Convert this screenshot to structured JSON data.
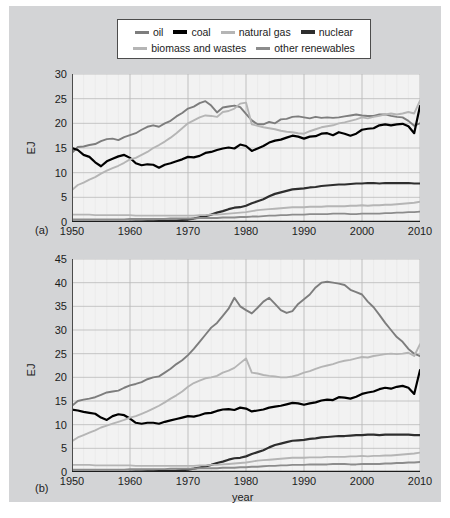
{
  "legend": {
    "rows": [
      [
        {
          "label": "oil",
          "color": "#7d7d7d",
          "width": 3
        },
        {
          "label": "coal",
          "color": "#000000",
          "width": 4
        },
        {
          "label": "natural gas",
          "color": "#b5b5b5",
          "width": 3
        },
        {
          "label": "nuclear",
          "color": "#2e2e2e",
          "width": 4
        }
      ],
      [
        {
          "label": "biomass and wastes",
          "color": "#b5b5b5",
          "width": 3
        },
        {
          "label": "other renewables",
          "color": "#8c8c8c",
          "width": 3
        }
      ]
    ]
  },
  "panel_a": {
    "tag": "(a)",
    "ylabel": "EJ"
  },
  "panel_b": {
    "tag": "(b)",
    "ylabel": "EJ",
    "xlabel": "year"
  },
  "chart_data": [
    {
      "type": "line",
      "panel": "(a)",
      "title": "",
      "xlabel": "",
      "ylabel": "EJ",
      "xlim": [
        1950,
        2010
      ],
      "ylim": [
        0,
        30
      ],
      "yticks": [
        0,
        5,
        10,
        15,
        20,
        25,
        30
      ],
      "xticks": [
        1950,
        1960,
        1970,
        1980,
        1990,
        2000,
        2010
      ],
      "grid": true,
      "legend_position": "top",
      "x": [
        1950,
        1951,
        1952,
        1953,
        1954,
        1955,
        1956,
        1957,
        1958,
        1959,
        1960,
        1961,
        1962,
        1963,
        1964,
        1965,
        1966,
        1967,
        1968,
        1969,
        1970,
        1971,
        1972,
        1973,
        1974,
        1975,
        1976,
        1977,
        1978,
        1979,
        1980,
        1981,
        1982,
        1983,
        1984,
        1985,
        1986,
        1987,
        1988,
        1989,
        1990,
        1991,
        1992,
        1993,
        1994,
        1995,
        1996,
        1997,
        1998,
        1999,
        2000,
        2001,
        2002,
        2003,
        2004,
        2005,
        2006,
        2007,
        2008,
        2009,
        2010
      ],
      "series": [
        {
          "name": "oil",
          "color": "#7d7d7d",
          "values": [
            14.0,
            15.2,
            15.3,
            15.6,
            15.8,
            16.4,
            16.8,
            16.9,
            16.6,
            17.2,
            17.6,
            18.0,
            18.7,
            19.3,
            19.6,
            19.3,
            20.0,
            20.5,
            21.4,
            22.1,
            23.0,
            23.4,
            24.1,
            24.5,
            23.6,
            22.2,
            23.2,
            23.4,
            23.6,
            23.3,
            21.9,
            20.6,
            19.8,
            19.8,
            20.3,
            20.0,
            20.8,
            20.9,
            21.3,
            21.4,
            21.2,
            21.0,
            21.3,
            21.1,
            21.2,
            21.1,
            21.2,
            21.4,
            21.6,
            21.8,
            21.6,
            21.5,
            21.5,
            21.8,
            21.8,
            21.5,
            21.3,
            21.2,
            20.5,
            19.5,
            20.0
          ]
        },
        {
          "name": "coal",
          "color": "#000000",
          "values": [
            15.0,
            14.6,
            13.6,
            13.2,
            12.1,
            11.3,
            12.3,
            12.8,
            13.3,
            13.6,
            13.0,
            11.9,
            11.5,
            11.7,
            11.6,
            11.0,
            11.6,
            11.9,
            12.3,
            12.7,
            13.2,
            13.1,
            13.4,
            14.0,
            14.2,
            14.6,
            14.9,
            15.1,
            14.9,
            15.7,
            15.4,
            14.4,
            14.9,
            15.4,
            16.1,
            16.5,
            16.7,
            17.1,
            17.5,
            17.3,
            16.9,
            17.3,
            17.4,
            17.9,
            18.0,
            17.6,
            18.2,
            17.9,
            17.5,
            17.9,
            18.7,
            18.9,
            19.0,
            19.6,
            19.8,
            19.6,
            19.8,
            19.9,
            19.4,
            18.0,
            23.5
          ]
        },
        {
          "name": "natural gas",
          "color": "#b5b5b5",
          "values": [
            6.5,
            7.5,
            8.0,
            8.6,
            9.1,
            9.8,
            10.4,
            10.9,
            11.4,
            12.0,
            12.7,
            13.0,
            13.6,
            14.2,
            15.0,
            15.6,
            16.3,
            17.1,
            18.0,
            19.0,
            20.0,
            20.6,
            21.2,
            21.6,
            21.5,
            21.3,
            22.3,
            22.5,
            23.0,
            24.0,
            24.2,
            19.8,
            19.5,
            19.2,
            19.0,
            18.8,
            18.5,
            18.3,
            18.2,
            18.0,
            17.9,
            18.4,
            18.8,
            19.2,
            19.4,
            19.6,
            20.0,
            20.2,
            20.5,
            20.8,
            21.2,
            21.0,
            21.3,
            21.5,
            21.8,
            22.0,
            21.8,
            22.0,
            22.3,
            22.0,
            24.6
          ]
        },
        {
          "name": "nuclear",
          "color": "#2e2e2e",
          "values": [
            0.0,
            0.0,
            0.0,
            0.0,
            0.0,
            0.0,
            0.0,
            0.0,
            0.0,
            0.0,
            0.05,
            0.07,
            0.1,
            0.12,
            0.15,
            0.18,
            0.22,
            0.26,
            0.3,
            0.4,
            0.5,
            0.7,
            0.95,
            1.2,
            1.5,
            1.9,
            2.2,
            2.6,
            2.9,
            3.0,
            3.3,
            3.8,
            4.2,
            4.6,
            5.2,
            5.7,
            6.0,
            6.3,
            6.6,
            6.7,
            6.8,
            7.0,
            7.1,
            7.3,
            7.4,
            7.5,
            7.6,
            7.6,
            7.7,
            7.8,
            7.8,
            7.9,
            7.9,
            7.8,
            7.9,
            7.9,
            7.9,
            7.9,
            7.9,
            7.8,
            7.8
          ]
        },
        {
          "name": "biomass and wastes",
          "color": "#b5b5b5",
          "values": [
            1.5,
            1.5,
            1.5,
            1.5,
            1.4,
            1.4,
            1.4,
            1.4,
            1.4,
            1.4,
            1.4,
            1.3,
            1.3,
            1.3,
            1.3,
            1.3,
            1.3,
            1.3,
            1.3,
            1.3,
            1.3,
            1.3,
            1.4,
            1.4,
            1.5,
            1.5,
            1.6,
            1.7,
            1.8,
            1.9,
            2.0,
            2.2,
            2.4,
            2.5,
            2.6,
            2.7,
            2.8,
            2.9,
            3.0,
            3.0,
            3.0,
            3.1,
            3.1,
            3.1,
            3.2,
            3.2,
            3.2,
            3.2,
            3.3,
            3.3,
            3.4,
            3.3,
            3.4,
            3.4,
            3.5,
            3.5,
            3.6,
            3.7,
            3.8,
            3.9,
            4.1
          ]
        },
        {
          "name": "other renewables",
          "color": "#8c8c8c",
          "values": [
            0.5,
            0.5,
            0.5,
            0.5,
            0.5,
            0.5,
            0.5,
            0.5,
            0.5,
            0.5,
            0.6,
            0.6,
            0.6,
            0.6,
            0.6,
            0.6,
            0.6,
            0.7,
            0.7,
            0.7,
            0.7,
            0.7,
            0.8,
            0.8,
            0.8,
            0.8,
            0.9,
            0.9,
            0.9,
            1.0,
            1.0,
            1.1,
            1.1,
            1.2,
            1.3,
            1.3,
            1.4,
            1.4,
            1.5,
            1.5,
            1.5,
            1.6,
            1.6,
            1.6,
            1.6,
            1.7,
            1.7,
            1.7,
            1.6,
            1.6,
            1.7,
            1.7,
            1.7,
            1.7,
            1.8,
            1.8,
            1.9,
            1.9,
            2.0,
            2.0,
            2.1
          ]
        }
      ]
    },
    {
      "type": "line",
      "panel": "(b)",
      "title": "",
      "xlabel": "year",
      "ylabel": "EJ",
      "xlim": [
        1950,
        2010
      ],
      "ylim": [
        0,
        45
      ],
      "yticks": [
        0,
        5,
        10,
        15,
        20,
        25,
        30,
        35,
        40,
        45
      ],
      "xticks": [
        1950,
        1960,
        1970,
        1980,
        1990,
        2000,
        2010
      ],
      "grid": true,
      "legend_position": "top",
      "x": [
        1950,
        1951,
        1952,
        1953,
        1954,
        1955,
        1956,
        1957,
        1958,
        1959,
        1960,
        1961,
        1962,
        1963,
        1964,
        1965,
        1966,
        1967,
        1968,
        1969,
        1970,
        1971,
        1972,
        1973,
        1974,
        1975,
        1976,
        1977,
        1978,
        1979,
        1980,
        1981,
        1982,
        1983,
        1984,
        1985,
        1986,
        1987,
        1988,
        1989,
        1990,
        1991,
        1992,
        1993,
        1994,
        1995,
        1996,
        1997,
        1998,
        1999,
        2000,
        2001,
        2002,
        2003,
        2004,
        2005,
        2006,
        2007,
        2008,
        2009,
        2010
      ],
      "series": [
        {
          "name": "oil",
          "color": "#7d7d7d",
          "values": [
            14.0,
            15.0,
            15.3,
            15.5,
            15.8,
            16.3,
            16.8,
            17.0,
            17.2,
            17.8,
            18.3,
            18.6,
            19.0,
            19.6,
            20.0,
            20.2,
            21.0,
            21.8,
            22.8,
            23.6,
            24.7,
            26.0,
            27.5,
            29.0,
            30.5,
            31.5,
            33.0,
            34.5,
            36.8,
            35.0,
            34.2,
            33.5,
            34.7,
            36.0,
            36.8,
            35.5,
            34.2,
            33.6,
            34.0,
            35.5,
            36.5,
            37.5,
            39.0,
            40.0,
            40.2,
            40.0,
            39.8,
            39.5,
            38.5,
            38.0,
            37.5,
            36.0,
            34.8,
            33.2,
            31.5,
            30.0,
            28.5,
            27.5,
            26.0,
            25.0,
            24.5
          ]
        },
        {
          "name": "coal",
          "color": "#000000",
          "values": [
            13.2,
            13.0,
            12.7,
            12.5,
            12.3,
            11.5,
            11.0,
            11.8,
            12.2,
            12.0,
            11.3,
            10.4,
            10.2,
            10.4,
            10.4,
            10.2,
            10.6,
            10.9,
            11.2,
            11.5,
            11.8,
            11.7,
            12.0,
            12.4,
            12.5,
            12.9,
            13.2,
            13.3,
            13.1,
            13.6,
            13.4,
            12.8,
            13.0,
            13.2,
            13.6,
            13.8,
            14.0,
            14.3,
            14.6,
            14.5,
            14.2,
            14.5,
            14.7,
            15.1,
            15.3,
            15.2,
            15.8,
            15.7,
            15.5,
            15.9,
            16.5,
            16.8,
            17.0,
            17.5,
            17.8,
            17.6,
            18.0,
            18.2,
            17.8,
            16.5,
            21.5
          ]
        },
        {
          "name": "natural gas",
          "color": "#b5b5b5",
          "values": [
            6.5,
            7.3,
            7.8,
            8.3,
            8.8,
            9.4,
            9.8,
            10.2,
            10.6,
            11.0,
            11.5,
            11.8,
            12.3,
            12.8,
            13.4,
            14.0,
            14.7,
            15.5,
            16.2,
            17.0,
            18.0,
            18.8,
            19.3,
            19.8,
            20.0,
            20.3,
            21.0,
            21.4,
            22.0,
            23.0,
            24.0,
            21.0,
            20.8,
            20.5,
            20.3,
            20.2,
            20.0,
            20.0,
            20.2,
            20.5,
            21.0,
            21.3,
            21.8,
            22.2,
            22.5,
            22.8,
            23.2,
            23.5,
            23.7,
            24.0,
            24.3,
            24.2,
            24.5,
            24.7,
            24.9,
            25.0,
            24.9,
            25.0,
            25.2,
            24.5,
            27.0
          ]
        },
        {
          "name": "nuclear",
          "color": "#2e2e2e",
          "values": [
            0.0,
            0.0,
            0.0,
            0.0,
            0.0,
            0.0,
            0.0,
            0.0,
            0.0,
            0.0,
            0.05,
            0.07,
            0.1,
            0.12,
            0.15,
            0.18,
            0.22,
            0.26,
            0.3,
            0.4,
            0.5,
            0.7,
            0.95,
            1.2,
            1.5,
            1.9,
            2.2,
            2.6,
            2.9,
            3.0,
            3.3,
            3.8,
            4.2,
            4.6,
            5.2,
            5.7,
            6.0,
            6.3,
            6.6,
            6.7,
            6.8,
            7.0,
            7.1,
            7.3,
            7.4,
            7.5,
            7.6,
            7.6,
            7.7,
            7.8,
            7.8,
            7.9,
            7.9,
            7.8,
            7.9,
            7.9,
            7.9,
            7.9,
            7.9,
            7.8,
            7.8
          ]
        },
        {
          "name": "biomass and wastes",
          "color": "#b5b5b5",
          "values": [
            1.5,
            1.5,
            1.5,
            1.5,
            1.4,
            1.4,
            1.4,
            1.4,
            1.4,
            1.4,
            1.4,
            1.3,
            1.3,
            1.3,
            1.3,
            1.3,
            1.3,
            1.3,
            1.3,
            1.3,
            1.3,
            1.3,
            1.4,
            1.4,
            1.5,
            1.5,
            1.6,
            1.7,
            1.8,
            1.9,
            2.0,
            2.2,
            2.4,
            2.5,
            2.6,
            2.7,
            2.8,
            2.9,
            3.0,
            3.0,
            3.0,
            3.1,
            3.1,
            3.1,
            3.2,
            3.2,
            3.2,
            3.2,
            3.3,
            3.3,
            3.4,
            3.3,
            3.4,
            3.4,
            3.5,
            3.5,
            3.6,
            3.7,
            3.8,
            3.9,
            4.1
          ]
        },
        {
          "name": "other renewables",
          "color": "#8c8c8c",
          "values": [
            0.5,
            0.5,
            0.5,
            0.5,
            0.5,
            0.5,
            0.5,
            0.5,
            0.5,
            0.5,
            0.6,
            0.6,
            0.6,
            0.6,
            0.6,
            0.6,
            0.6,
            0.7,
            0.7,
            0.7,
            0.7,
            0.7,
            0.8,
            0.8,
            0.8,
            0.8,
            0.9,
            0.9,
            0.9,
            1.0,
            1.0,
            1.1,
            1.1,
            1.2,
            1.3,
            1.3,
            1.4,
            1.4,
            1.5,
            1.5,
            1.5,
            1.6,
            1.6,
            1.6,
            1.6,
            1.7,
            1.7,
            1.7,
            1.6,
            1.6,
            1.7,
            1.7,
            1.7,
            1.7,
            1.8,
            1.8,
            1.9,
            1.9,
            2.0,
            2.0,
            2.1
          ]
        }
      ]
    }
  ]
}
